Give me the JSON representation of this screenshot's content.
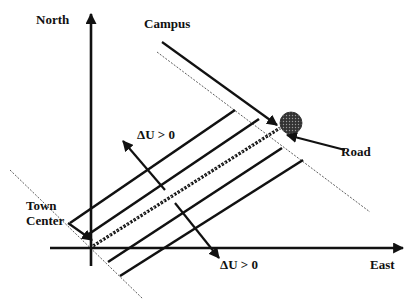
{
  "labels": {
    "north": "North",
    "east": "East",
    "campus": "Campus",
    "road": "Road",
    "town_line1": "Town",
    "town_line2": "Center",
    "delta_u_upper": "ΔU > 0",
    "delta_u_lower": "ΔU > 0"
  },
  "colors": {
    "ink": "#111111",
    "background": "#ffffff",
    "campus_marker": "#555555"
  },
  "diagram": {
    "origin": [
      91,
      242
    ],
    "axes": {
      "north_top": [
        91,
        12
      ],
      "north_bottom": [
        91,
        266
      ],
      "east_left": [
        50,
        248
      ],
      "east_right": [
        405,
        248
      ]
    },
    "campus_point": [
      291,
      123
    ],
    "road_segment": {
      "from": [
        93,
        246
      ],
      "to": [
        280,
        128
      ],
      "style": "dashed"
    },
    "iso_lines": [
      {
        "from": [
          70,
          223
        ],
        "to": [
          235,
          110
        ]
      },
      {
        "from": [
          83,
          238
        ],
        "to": [
          259,
          119
        ]
      },
      {
        "from": [
          108,
          262
        ],
        "to": [
          282,
          148
        ]
      },
      {
        "from": [
          120,
          276
        ],
        "to": [
          303,
          160
        ]
      }
    ],
    "boundary_lines": [
      {
        "from": [
          10,
          170
        ],
        "to": [
          143,
          299
        ],
        "style": "thin-dashed"
      },
      {
        "from": [
          157,
          52
        ],
        "to": [
          370,
          212
        ],
        "style": "thin-dashed"
      }
    ],
    "pointer_arrows": {
      "campus": {
        "from": [
          162,
          42
        ],
        "to": [
          277,
          125
        ]
      },
      "road": {
        "from": [
          345,
          150
        ],
        "to": [
          287,
          135
        ]
      },
      "town_center": {
        "from": [
          68,
          223
        ],
        "to": [
          92,
          240
        ]
      },
      "delta_u_upper": {
        "from": [
          152,
          186
        ],
        "to": [
          116,
          146
        ]
      },
      "delta_u_lower": {
        "from": [
          174,
          206
        ],
        "to": [
          219,
          257
        ]
      }
    }
  }
}
